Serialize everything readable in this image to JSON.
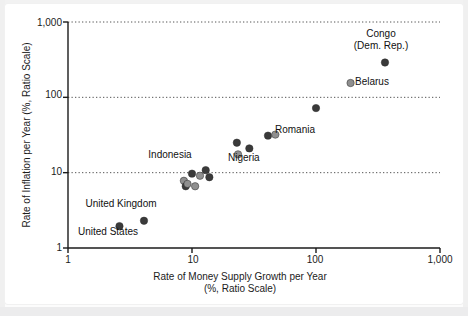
{
  "chart_data": {
    "type": "scatter",
    "title": "",
    "xlabel": "Rate of Money Supply Growth per Year\n(%, Ratio Scale)",
    "xlabel_line1": "Rate of Money Supply Growth per Year",
    "xlabel_line2": "(%, Ratio Scale)",
    "ylabel": "Rate of Inflation per Year (%, Ratio Scale)",
    "xscale": "log",
    "yscale": "log",
    "xlim": [
      1,
      1000
    ],
    "ylim": [
      1,
      1000
    ],
    "xticks": [
      1,
      10,
      100,
      1000
    ],
    "xtick_labels": [
      "1",
      "10",
      "100",
      "1,000"
    ],
    "yticks": [
      1,
      10,
      100,
      1000
    ],
    "ytick_labels": [
      "1",
      "10",
      "100",
      "1,000"
    ],
    "grid": "horizontal dotted gridlines at 10, 100, 1,000",
    "legend": "none",
    "marker_colors": {
      "unlabeled": "#3a3a3a",
      "labeled": "#8f8f8f"
    },
    "points": [
      {
        "name": "United States",
        "x": 2.6,
        "y": 1.95,
        "style": "unlabeled",
        "labeled": true,
        "label": "United States",
        "label_pos": "below-left"
      },
      {
        "name": "United Kingdom",
        "x": 4.1,
        "y": 2.3,
        "style": "unlabeled",
        "labeled": true,
        "label": "United Kingdom",
        "label_pos": "above-left"
      },
      {
        "name": "point-a",
        "x": 8.6,
        "y": 7.8,
        "style": "labeled",
        "labeled": false,
        "label": "",
        "label_pos": ""
      },
      {
        "name": "point-b",
        "x": 8.9,
        "y": 6.6,
        "style": "unlabeled",
        "labeled": false,
        "label": "",
        "label_pos": ""
      },
      {
        "name": "point-c",
        "x": 9.2,
        "y": 7.1,
        "style": "labeled",
        "labeled": false,
        "label": "",
        "label_pos": ""
      },
      {
        "name": "Indonesia",
        "x": 10.0,
        "y": 9.7,
        "style": "unlabeled",
        "labeled": true,
        "label": "Indonesia",
        "label_pos": "above"
      },
      {
        "name": "point-d",
        "x": 10.6,
        "y": 6.6,
        "style": "labeled",
        "labeled": false,
        "label": "",
        "label_pos": ""
      },
      {
        "name": "point-e",
        "x": 11.6,
        "y": 9.1,
        "style": "labeled",
        "labeled": false,
        "label": "",
        "label_pos": ""
      },
      {
        "name": "point-f",
        "x": 12.9,
        "y": 10.8,
        "style": "unlabeled",
        "labeled": false,
        "label": "",
        "label_pos": ""
      },
      {
        "name": "point-g",
        "x": 13.8,
        "y": 8.7,
        "style": "unlabeled",
        "labeled": false,
        "label": "",
        "label_pos": ""
      },
      {
        "name": "point-h",
        "x": 23.0,
        "y": 25.0,
        "style": "unlabeled",
        "labeled": false,
        "label": "",
        "label_pos": ""
      },
      {
        "name": "Nigeria",
        "x": 23.5,
        "y": 17.5,
        "style": "labeled",
        "labeled": true,
        "label": "Nigeria",
        "label_pos": "below"
      },
      {
        "name": "point-i",
        "x": 29.0,
        "y": 21.0,
        "style": "unlabeled",
        "labeled": false,
        "label": "",
        "label_pos": ""
      },
      {
        "name": "point-j",
        "x": 41.0,
        "y": 31.0,
        "style": "unlabeled",
        "labeled": false,
        "label": "",
        "label_pos": ""
      },
      {
        "name": "Romania",
        "x": 47.0,
        "y": 32.0,
        "style": "labeled",
        "labeled": true,
        "label": "Romania",
        "label_pos": "right"
      },
      {
        "name": "point-k",
        "x": 100.0,
        "y": 72.0,
        "style": "unlabeled",
        "labeled": false,
        "label": "",
        "label_pos": ""
      },
      {
        "name": "Belarus",
        "x": 190.0,
        "y": 155.0,
        "style": "labeled",
        "labeled": true,
        "label": "Belarus",
        "label_pos": "right"
      },
      {
        "name": "Congo (Dem. Rep.)",
        "x": 360.0,
        "y": 290.0,
        "style": "unlabeled",
        "labeled": true,
        "label": "Congo\n(Dem. Rep.)",
        "label_pos": "above"
      }
    ],
    "annotations": [
      {
        "text": "Congo",
        "for": "Congo (Dem. Rep.)"
      },
      {
        "text": "(Dem. Rep.)",
        "for": "Congo (Dem. Rep.)"
      },
      {
        "text": "Belarus",
        "for": "Belarus"
      },
      {
        "text": "Romania",
        "for": "Romania"
      },
      {
        "text": "Nigeria",
        "for": "Nigeria"
      },
      {
        "text": "Indonesia",
        "for": "Indonesia"
      },
      {
        "text": "United Kingdom",
        "for": "United Kingdom"
      },
      {
        "text": "United States",
        "for": "United States"
      }
    ]
  },
  "axes": {
    "y_title": "Rate of Inflation per Year (%, Ratio Scale)",
    "x_title_line1": "Rate of Money Supply Growth per Year",
    "x_title_line2": "(%, Ratio Scale)",
    "y_ticks": [
      "1,000",
      "100",
      "10",
      "1"
    ],
    "x_ticks": [
      "1",
      "10",
      "100",
      "1,000"
    ]
  },
  "labels": {
    "congo_line1": "Congo",
    "congo_line2": "(Dem. Rep.)",
    "belarus": "Belarus",
    "romania": "Romania",
    "nigeria": "Nigeria",
    "indonesia": "Indonesia",
    "united_kingdom": "United Kingdom",
    "united_states": "United States"
  },
  "colors": {
    "marker_dark": "#3a3a3a",
    "marker_light": "#8f8f8f",
    "axis": "#1b1b1b",
    "grid": "#555555",
    "background": "#ffffff"
  }
}
